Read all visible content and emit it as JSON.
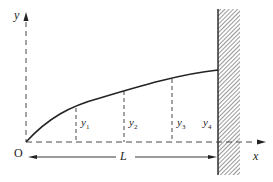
{
  "diagram": {
    "axes": {
      "x_label": "x",
      "y_label": "y",
      "origin_label": "O"
    },
    "dimension": {
      "label": "L"
    },
    "ordinates": [
      {
        "base": "y",
        "sub": "1"
      },
      {
        "base": "y",
        "sub": "2"
      },
      {
        "base": "y",
        "sub": "3"
      },
      {
        "base": "y",
        "sub": "4"
      }
    ],
    "wall": {
      "type": "fixed-support-hatched"
    },
    "colors": {
      "line": "#222222",
      "hatch": "#333333",
      "background": "#ffffff"
    }
  }
}
